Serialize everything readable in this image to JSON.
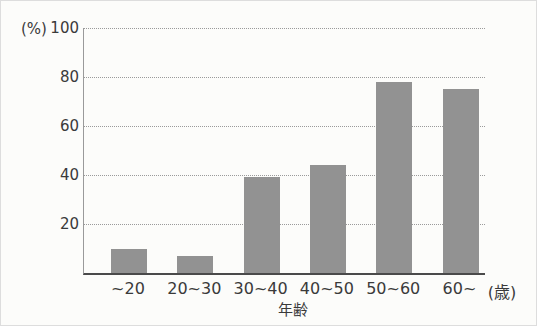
{
  "chart": {
    "y_unit_label": "(%)",
    "x_unit_label": "(歳)",
    "x_axis_title": "年齢"
  },
  "chart_data": {
    "type": "bar",
    "title": "",
    "categories": [
      "~20",
      "20~30",
      "30~40",
      "40~50",
      "50~60",
      "60~"
    ],
    "values": [
      10,
      7,
      39,
      44,
      78,
      75
    ],
    "xlabel": "年齢",
    "ylabel": "(%)",
    "x_unit": "(歳)",
    "ylim": [
      0,
      100
    ],
    "yticks": [
      20,
      40,
      60,
      80,
      100
    ],
    "grid": true,
    "gridline_style": "dotted",
    "legend": false,
    "bar_color": "#929292",
    "background_color": "#fcfcfa",
    "axis_color": "#4a4a4a"
  }
}
